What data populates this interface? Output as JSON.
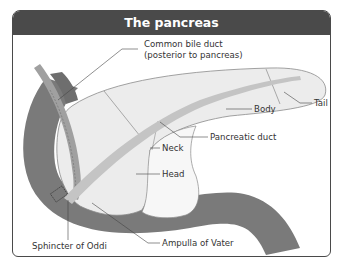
{
  "title": "The pancreas",
  "colors": {
    "title_bar": "#4a4a4a",
    "title_text": "#ffffff",
    "duodenum": "#7a7a7a",
    "pancreas_fill": "#ececec",
    "head_fill": "#f7f7f7",
    "pancreatic_duct": "#c4c4c4",
    "bile_duct": "#a0a0a0",
    "bile_duct_posterior": "#6e6e6e",
    "outline": "#8a8a8a",
    "leader_line": "#444444"
  },
  "labels": {
    "common_bile_duct_line1": "Common bile duct",
    "common_bile_duct_line2": "(posterior to pancreas)",
    "body": "Body",
    "tail": "Tail",
    "pancreatic_duct": "Pancreatic duct",
    "neck": "Neck",
    "head": "Head",
    "sphincter_of_oddi": "Sphincter of Oddi",
    "ampulla_of_vater": "Ampulla of Vater"
  }
}
